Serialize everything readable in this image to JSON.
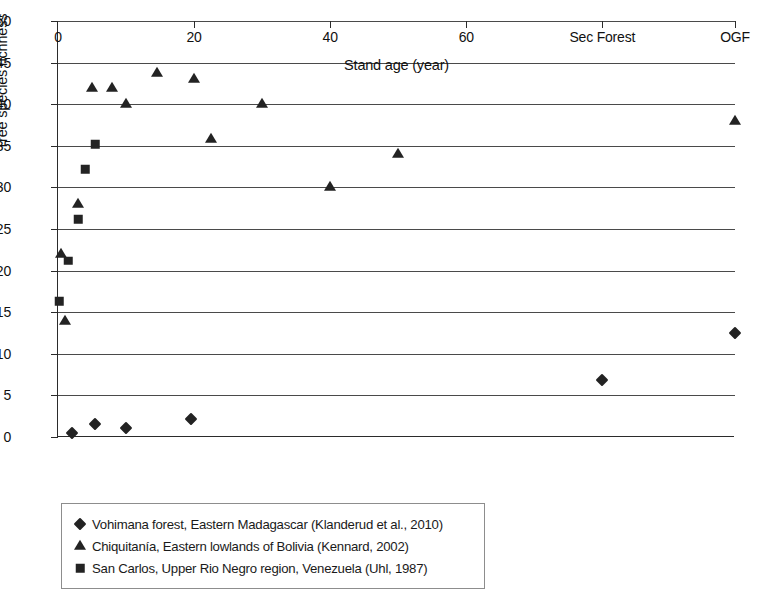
{
  "chart_data": {
    "type": "scatter",
    "title": "",
    "xlabel": "Stand age (year)",
    "ylabel": "Tree species richness",
    "xlim": [
      0,
      99.5
    ],
    "ylim": [
      0,
      50
    ],
    "grid": "horizontal",
    "legend_position": "below-plot-left",
    "y_ticks": [
      0,
      5,
      10,
      15,
      20,
      25,
      30,
      35,
      40,
      45,
      50
    ],
    "y_tick_labels": [
      "0",
      "5",
      "10",
      "15",
      "20",
      "25",
      "30",
      "35",
      "40",
      "45",
      "50"
    ],
    "x_ticks": [
      0,
      20,
      40,
      60,
      80,
      99.5
    ],
    "x_tick_labels": [
      "0",
      "20",
      "40",
      "60",
      "Sec Forest",
      "OGF"
    ],
    "categorical_x": [
      "Sec Forest",
      "OGF"
    ],
    "series": [
      {
        "name": "Vohimana forest, Eastern Madagascar (Klanderud et al., 2010)",
        "marker": "diamond",
        "color": "#232323",
        "points": [
          {
            "x": 2.0,
            "y": 0.5
          },
          {
            "x": 5.5,
            "y": 1.6
          },
          {
            "x": 10.0,
            "y": 1.1
          },
          {
            "x": 19.5,
            "y": 2.2
          },
          {
            "x": 80.0,
            "y": 6.8,
            "x_label": "Sec Forest"
          },
          {
            "x": 99.5,
            "y": 12.5,
            "x_label": "OGF"
          }
        ]
      },
      {
        "name": "Chiquitanía, Eastern lowlands of Bolivia (Kennard, 2002)",
        "marker": "triangle",
        "color": "#232323",
        "points": [
          {
            "x": 1.0,
            "y": 14.0
          },
          {
            "x": 0.5,
            "y": 22.0
          },
          {
            "x": 3.0,
            "y": 28.0
          },
          {
            "x": 5.0,
            "y": 42.0
          },
          {
            "x": 8.0,
            "y": 42.0
          },
          {
            "x": 10.0,
            "y": 40.0
          },
          {
            "x": 14.5,
            "y": 43.8
          },
          {
            "x": 20.0,
            "y": 43.0
          },
          {
            "x": 22.5,
            "y": 35.8
          },
          {
            "x": 30.0,
            "y": 40.0
          },
          {
            "x": 40.0,
            "y": 30.0
          },
          {
            "x": 50.0,
            "y": 34.0
          },
          {
            "x": 99.5,
            "y": 38.0,
            "x_label": "OGF"
          }
        ]
      },
      {
        "name": "San Carlos, Upper Rio Negro region, Venezuela (Uhl, 1987)",
        "marker": "square",
        "color": "#232323",
        "points": [
          {
            "x": 0.2,
            "y": 16.3
          },
          {
            "x": 1.5,
            "y": 21.2
          },
          {
            "x": 3.0,
            "y": 26.2
          },
          {
            "x": 4.0,
            "y": 32.2
          },
          {
            "x": 5.5,
            "y": 35.2
          }
        ]
      }
    ]
  },
  "legend": {
    "items": [
      {
        "marker": "diamond",
        "label": "Vohimana forest, Eastern Madagascar (Klanderud et al., 2010)"
      },
      {
        "marker": "triangle",
        "label": "Chiquitanía, Eastern lowlands of Bolivia (Kennard, 2002)"
      },
      {
        "marker": "square",
        "label": "San Carlos, Upper Rio Negro region, Venezuela (Uhl, 1987)"
      }
    ]
  },
  "colors": {
    "marker": "#232323",
    "axis": "#2b2b2b",
    "grid": "#4a4a4a",
    "legend_border": "#8d8d8d",
    "background": "#ffffff"
  }
}
